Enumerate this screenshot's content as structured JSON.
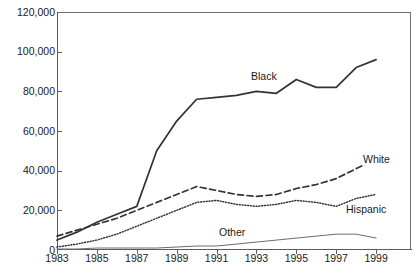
{
  "chart_data": {
    "type": "line",
    "title": "",
    "xlabel": "",
    "ylabel": "",
    "xlim": [
      1983,
      2000.75
    ],
    "ylim": [
      0,
      120000
    ],
    "grid": false,
    "legend_position": "inline-labels",
    "x": [
      1983,
      1984,
      1985,
      1986,
      1987,
      1988,
      1989,
      1990,
      1991,
      1992,
      1993,
      1994,
      1995,
      1996,
      1997,
      1998,
      1999
    ],
    "y_ticks": [
      0,
      20000,
      40000,
      60000,
      80000,
      100000,
      120000
    ],
    "y_tick_labels": [
      "0",
      "20,000",
      "40,000",
      "60,000",
      "80,000",
      "100,000",
      "120,000"
    ],
    "x_ticks": [
      1983,
      1985,
      1987,
      1989,
      1991,
      1993,
      1995,
      1997,
      1999
    ],
    "x_tick_labels": [
      "1983",
      "1985",
      "1987",
      "1989",
      "1991",
      "1993",
      "1995",
      "1997",
      "1999"
    ],
    "series": [
      {
        "name": "Black",
        "style": "solid",
        "color": "#333333",
        "label": "Black",
        "values": [
          5000,
          9000,
          14000,
          18000,
          22000,
          50000,
          65000,
          76000,
          77000,
          78000,
          80000,
          79000,
          86000,
          82000,
          82000,
          92000,
          96000
        ]
      },
      {
        "name": "White",
        "style": "dashed",
        "color": "#333333",
        "label": "White",
        "values": [
          7000,
          10000,
          13000,
          16000,
          20000,
          24000,
          28000,
          32000,
          30000,
          28000,
          27000,
          28000,
          31000,
          33000,
          36000,
          41000,
          46000
        ]
      },
      {
        "name": "Hispanic",
        "style": "dotted",
        "color": "#333333",
        "label": "Hispanic",
        "values": [
          1500,
          3000,
          5000,
          8000,
          12000,
          16000,
          20000,
          24000,
          25000,
          23000,
          22000,
          23000,
          25000,
          24000,
          22000,
          26000,
          28000
        ]
      },
      {
        "name": "Other",
        "style": "solid-thin",
        "color": "#6b6b70",
        "label": "Other",
        "values": [
          500,
          500,
          1000,
          1000,
          1000,
          1000,
          1500,
          2000,
          2000,
          3000,
          4000,
          5000,
          6000,
          7000,
          8000,
          8000,
          6000
        ]
      }
    ]
  },
  "axis": {
    "y_labels": [
      "120,000",
      "100,000",
      "80,000",
      "60,000",
      "40,000",
      "20,000",
      "0"
    ],
    "x_labels": [
      "1983",
      "1985",
      "1987",
      "1989",
      "1991",
      "1993",
      "1995",
      "1997",
      "1999"
    ]
  },
  "series_labels": {
    "black": "Black",
    "white": "White",
    "hispanic": "Hispanic",
    "other": "Other"
  },
  "title_clip": ""
}
